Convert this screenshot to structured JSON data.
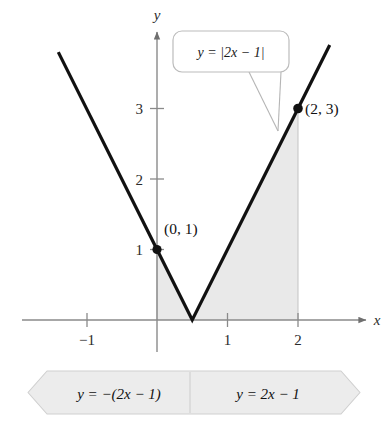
{
  "figure": {
    "title_visible": false,
    "axes": {
      "x_label": "x",
      "y_label": "y",
      "x_ticks": [
        {
          "value": -1,
          "label": "−1"
        },
        {
          "value": 1,
          "label": "1"
        },
        {
          "value": 2,
          "label": "2"
        }
      ],
      "y_ticks": [
        {
          "value": 1,
          "label": "1"
        },
        {
          "value": 2,
          "label": "2"
        },
        {
          "value": 3,
          "label": "3"
        }
      ],
      "x_range": [
        -1.6,
        3.05
      ],
      "y_range": [
        -0.25,
        4.2
      ],
      "origin_px": {
        "x": 157,
        "y": 320
      },
      "unit_px": 70.5
    },
    "callout": {
      "text": "y = |2x − 1|",
      "parts": {
        "lhs": "y",
        "eq": "=",
        "rhs": "|2x − 1|"
      }
    },
    "points": [
      {
        "label": "(0, 1)",
        "x": 0,
        "y": 1
      },
      {
        "label": "(2, 3)",
        "x": 2,
        "y": 3
      }
    ],
    "banner": {
      "left_label": "y = −(2x − 1)",
      "right_label": "y = 2x − 1"
    },
    "colors": {
      "curve": "#111111",
      "axis": "#8a8a8a",
      "shade_fill": "#e8e8e8",
      "shade_edge": "#bdbdbd",
      "callout_border": "#b9b9b9",
      "banner_fill": "#ececec",
      "banner_edge": "#c9c9c9",
      "text": "#111111"
    }
  },
  "chart_data": {
    "type": "line",
    "title": "",
    "xlabel": "x",
    "ylabel": "y",
    "xlim": [
      -1.6,
      3.05
    ],
    "ylim": [
      -0.25,
      4.2
    ],
    "grid": false,
    "legend": "none",
    "function": "y = |2x - 1|",
    "piecewise": [
      {
        "condition": "x < 0.5",
        "expression": "y = -(2x - 1)"
      },
      {
        "condition": "x >= 0.5",
        "expression": "y = 2x - 1"
      }
    ],
    "series": [
      {
        "name": "y = |2x - 1|",
        "x": [
          -1.4,
          0,
          0.5,
          2,
          2.45
        ],
        "values": [
          3.8,
          1,
          0,
          3,
          3.9
        ]
      }
    ],
    "annotated_points": [
      {
        "label": "(0, 1)",
        "x": 0,
        "y": 1
      },
      {
        "label": "(2, 3)",
        "x": 2,
        "y": 3
      }
    ],
    "shaded_region": {
      "description": "Area under y = |2x - 1| from x = 0 to x = 2",
      "x_from": 0,
      "x_to": 2
    },
    "xticks": [
      -1,
      1,
      2
    ],
    "xticklabels": [
      "−1",
      "1",
      "2"
    ],
    "yticks": [
      1,
      2,
      3
    ],
    "yticklabels": [
      "1",
      "2",
      "3"
    ]
  }
}
